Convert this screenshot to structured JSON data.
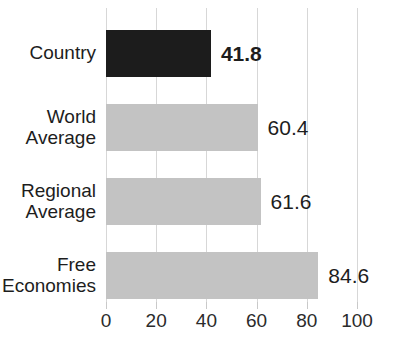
{
  "chart_data": {
    "type": "bar",
    "orientation": "horizontal",
    "title": "",
    "xlabel": "",
    "ylabel": "",
    "xlim": [
      0,
      100
    ],
    "xticks": [
      0,
      20,
      40,
      60,
      80,
      100
    ],
    "grid": true,
    "legend": false,
    "categories": [
      "Country",
      "World Average",
      "Regional Average",
      "Free Economies"
    ],
    "values": [
      41.8,
      60.4,
      61.6,
      84.6
    ],
    "value_labels": [
      "41.8",
      "60.4",
      "61.6",
      "84.6"
    ],
    "bars": [
      {
        "category": "Country",
        "category_lines": [
          "Country"
        ],
        "value": 41.8,
        "value_label": "41.8",
        "color": "#1c1c1c",
        "emphasis": true
      },
      {
        "category": "World Average",
        "category_lines": [
          "World",
          "Average"
        ],
        "value": 60.4,
        "value_label": "60.4",
        "color": "#c3c3c3",
        "emphasis": false
      },
      {
        "category": "Regional Average",
        "category_lines": [
          "Regional",
          "Average"
        ],
        "value": 61.6,
        "value_label": "61.6",
        "color": "#c3c3c3",
        "emphasis": false
      },
      {
        "category": "Free Economies",
        "category_lines": [
          "Free",
          "Economies"
        ],
        "value": 84.6,
        "value_label": "84.6",
        "color": "#c3c3c3",
        "emphasis": false
      }
    ],
    "colors": {
      "highlight_bar": "#1c1c1c",
      "reference_bar": "#c3c3c3",
      "gridline": "#d7d7d7",
      "text": "#1d1d1d",
      "background": "#ffffff"
    }
  },
  "axis": {
    "tick_labels": [
      "0",
      "20",
      "40",
      "60",
      "80",
      "100"
    ]
  }
}
